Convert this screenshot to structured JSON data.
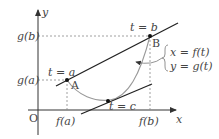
{
  "diagram": {
    "axes": {
      "x_label": "x",
      "y_label": "y",
      "origin_label": "O"
    },
    "ticks": {
      "x": [
        "f(a)",
        "f(b)"
      ],
      "y": [
        "g(a)",
        "g(b)"
      ]
    },
    "points": [
      {
        "name": "A",
        "param_label": "t = a"
      },
      {
        "name": "B",
        "param_label": "t = b"
      },
      {
        "name": "C",
        "param_label": "t = c"
      }
    ],
    "curve_equation": {
      "line1": "x = f(t)",
      "line2": "y = g(t)"
    },
    "colors": {
      "axis": "#333333",
      "line": "#222222",
      "curve": "#999999",
      "dashed": "#888888"
    }
  }
}
